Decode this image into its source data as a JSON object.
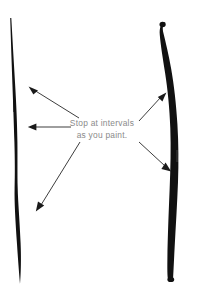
{
  "figure": {
    "name": "brushstroke-instruction-figure",
    "width": 204,
    "height": 301,
    "background_color": "#ffffff",
    "ink_color": "#111111",
    "annotation_color": "#1a1a1a",
    "caption_color": "#8a8a8a"
  },
  "caption": {
    "line1": "Stop at intervals",
    "line2": "as you paint.",
    "full_text": "Stop at intervals as you paint."
  },
  "strokes": [
    {
      "id": "left-brushstroke",
      "label": "thin tapered vertical brushstroke",
      "side": "left",
      "color": "#111111",
      "top_point": [
        10,
        18
      ],
      "bottom_point": [
        20,
        284
      ],
      "max_width": 3.4,
      "min_width": 0.7,
      "taper": "thin at top, tapered point at bottom"
    },
    {
      "id": "right-brushstroke",
      "label": "thick bowed vertical brushstroke",
      "side": "right",
      "color": "#111111",
      "top_point": [
        164,
        22
      ],
      "bottom_point": [
        173,
        281
      ],
      "max_width": 7.5,
      "min_width": 4.0,
      "taper": "blunt rounded cap at both ends, bows right at middle"
    }
  ],
  "arrows": [
    {
      "id": "arrow-upper-left",
      "label": "points to upper section of left stroke",
      "tail": [
        79,
        118
      ],
      "tip": [
        29,
        87
      ],
      "direction": "up-left"
    },
    {
      "id": "arrow-middle-left",
      "label": "points to middle section of left stroke",
      "tail": [
        71,
        127
      ],
      "tip": [
        28,
        127
      ],
      "direction": "left"
    },
    {
      "id": "arrow-lower-left",
      "label": "points to lower section of left stroke",
      "tail": [
        80,
        142
      ],
      "tip": [
        36,
        211
      ],
      "direction": "down-left"
    },
    {
      "id": "arrow-upper-right",
      "label": "points to upper section of right stroke",
      "tail": [
        139,
        121
      ],
      "tip": [
        166,
        93
      ],
      "direction": "up-right"
    },
    {
      "id": "arrow-lower-right",
      "label": "points to lower section of right stroke",
      "tail": [
        139,
        142
      ],
      "tip": [
        171,
        171
      ],
      "direction": "down-right"
    }
  ]
}
